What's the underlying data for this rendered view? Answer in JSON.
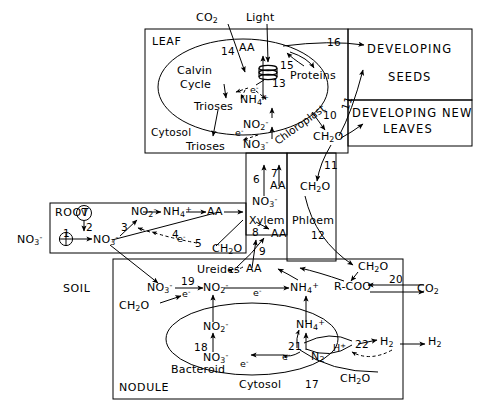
{
  "figure": {
    "type": "biological-pathway-diagram"
  },
  "compartments": {
    "leaf": "LEAF",
    "chloroplast": "Chloroplast",
    "leaf_cytosol": "Cytosol",
    "root": "ROOT",
    "soil": "SOIL",
    "nodule": "NODULE",
    "bacteroid": "Bacteroid",
    "nodule_cytosol": "Cytosol",
    "xylem": "Xylem",
    "phloem": "Phloem",
    "developing_seeds_line1": "DEVELOPING",
    "developing_seeds_line2": "SEEDS",
    "developing_leaves_line1": "DEVELOPING NEW",
    "developing_leaves_line2": "LEAVES"
  },
  "leaf_metabolites": {
    "co2": "CO2",
    "light": "Light",
    "calvin_cycle_line1": "Calvin",
    "calvin_cycle_line2": "Cycle",
    "trioses_chloroplast": "Trioses",
    "trioses_cytosol": "Trioses",
    "aa": "AA",
    "proteins": "Proteins",
    "nh4": "NH4+",
    "no2": "NO2-",
    "no3": "NO3-",
    "ch2o_leaf": "CH2O",
    "ch2o_phloem": "CH2O",
    "electron_chloroplast": "e-",
    "electron_cytosol": "e-"
  },
  "transport_column": {
    "no3": "NO3-",
    "aa": "AA"
  },
  "root_metabolites": {
    "no3_soil": "NO3-",
    "no3_root": "NO3-",
    "no2": "NO2-",
    "nh4": "NH4+",
    "aa": "AA",
    "vacuole": "V",
    "ch2o": "CH2O",
    "electron": "e-"
  },
  "xylem_metabolites": {
    "aa": "AA",
    "ureides": "Ureides",
    "aa_lower": "AA"
  },
  "nodule_metabolites": {
    "no3_cytosol": "NO3-",
    "no2_cytosol": "NO2-",
    "nh4_cytosol": "NH4+",
    "rcoo": "R-COO-",
    "co2": "CO2",
    "ch2o_soil": "CH2O",
    "ch2o_phloem": "CH2O",
    "ch2o_bacteroid": "CH2O",
    "no3_bacteroid": "NO3-",
    "no2_bacteroid": "NO2-",
    "nh4_bacteroid": "NH4+",
    "n2": "N2",
    "h_plus": "H+",
    "h2_inner": "H2",
    "h2_outer": "H2",
    "electron_1": "e-",
    "electron_2": "e-",
    "electron_3": "e-",
    "electron_4": "e-"
  },
  "step_numbers": {
    "n1": "1",
    "n2": "2",
    "n3": "3",
    "n4": "4",
    "n5": "5",
    "n6": "6",
    "n7": "7",
    "n8": "8",
    "n9": "9",
    "n10": "10",
    "n11_upper": "11",
    "n11_lower": "11",
    "n12": "12",
    "n13": "13",
    "n14": "14",
    "n15": "15",
    "n16": "16",
    "n17": "17",
    "n18": "18",
    "n19": "19",
    "n20": "20",
    "n21": "21",
    "n22": "22"
  },
  "colors": {
    "ink": "#000000",
    "background": "#ffffff"
  }
}
